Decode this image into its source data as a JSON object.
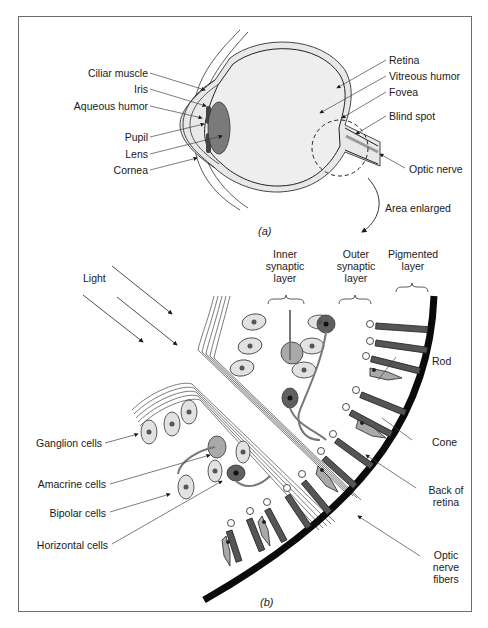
{
  "figure": {
    "panel_a": {
      "caption": "(a)",
      "left_labels": [
        "Ciliar muscle",
        "Iris",
        "Aqueous humor",
        "Pupil",
        "Lens",
        "Cornea"
      ],
      "right_labels": [
        "Retina",
        "Vitreous humor",
        "Fovea",
        "Blind spot",
        "Optic nerve"
      ],
      "callout": "Area enlarged"
    },
    "panel_b": {
      "caption": "(b)",
      "light_label": "Light",
      "layer_headers": {
        "inner": [
          "Inner",
          "synaptic",
          "layer"
        ],
        "outer": [
          "Outer",
          "synaptic",
          "layer"
        ],
        "pigmented": [
          "Pigmented",
          "layer"
        ]
      },
      "left_labels": [
        "Ganglion cells",
        "Amacrine cells",
        "Bipolar cells",
        "Horizontal cells"
      ],
      "right_labels": {
        "rod": "Rod",
        "cone": "Cone",
        "back": [
          "Back of",
          "retina"
        ],
        "optic": [
          "Optic",
          "nerve",
          "fibers"
        ]
      }
    },
    "colors": {
      "outline": "#1a1a1a",
      "light_fill": "#e6e6e6",
      "mid_fill": "#a9a9a9",
      "dark_fill": "#555555",
      "black_band": "#0a0a0a"
    }
  }
}
